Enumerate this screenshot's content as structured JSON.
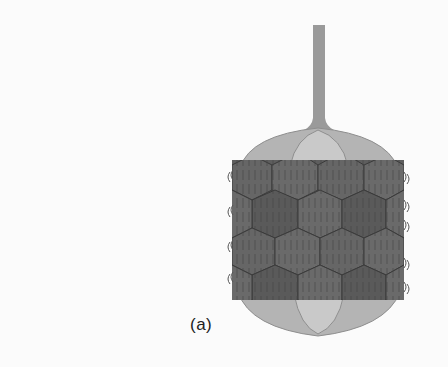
{
  "figure": {
    "panel_label": "(a)",
    "colors": {
      "background": "#fbfbfb",
      "tail": "#9a9a9a",
      "cap_outer": "#b4b4b4",
      "cap_inner": "#c9c9c9",
      "hexagon_fill": "#5e5e5e",
      "hexagon_alt": "#6a6a6a",
      "hexagon_stroke": "#3a3a3a",
      "hatch": "#444444",
      "fiber": "#555555"
    }
  }
}
